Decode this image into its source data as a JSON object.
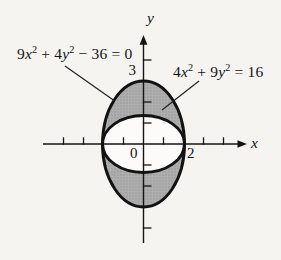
{
  "figure": {
    "type": "math-diagram",
    "colors": {
      "background": "#f5f4f1",
      "shade": "#aeaeae",
      "shade_dots": "#949494",
      "inner_fill": "#fcfbf9",
      "curve": "#121212",
      "axis": "#151515",
      "text": "#141414"
    },
    "equations": {
      "outer": {
        "text": "9x² + 4y² − 36 = 0",
        "segments": [
          {
            "t": "9"
          },
          {
            "t": "x",
            "i": true
          },
          {
            "t": "2",
            "sup": true
          },
          {
            "t": " + 4"
          },
          {
            "t": "y",
            "i": true
          },
          {
            "t": "2",
            "sup": true
          },
          {
            "t": " − 36 = 0"
          }
        ]
      },
      "inner": {
        "text": "4x² + 9y² = 16",
        "segments": [
          {
            "t": "4"
          },
          {
            "t": "x",
            "i": true
          },
          {
            "t": "2",
            "sup": true
          },
          {
            "t": " + 9"
          },
          {
            "t": "y",
            "i": true
          },
          {
            "t": "2",
            "sup": true
          },
          {
            "t": " = 16"
          }
        ]
      }
    },
    "axis_labels": {
      "x": "x",
      "y": "y"
    },
    "tick_labels": {
      "origin": "0",
      "x_2": "2",
      "y_3": "3"
    }
  },
  "chart_data": {
    "type": "line",
    "title": "",
    "xlabel": "x",
    "ylabel": "y",
    "curves": [
      {
        "name": "outer ellipse",
        "equation": "9x^2 + 4y^2 - 36 = 0",
        "x_intercepts": [
          -2,
          2
        ],
        "y_intercepts": [
          -3,
          3
        ]
      },
      {
        "name": "inner ellipse",
        "equation": "4x^2 + 9y^2 = 16",
        "x_intercepts": [
          -2,
          2
        ],
        "y_intercepts": [
          -1.333,
          1.333
        ]
      }
    ],
    "labeled_ticks": {
      "x": [
        0,
        2
      ],
      "y": [
        3
      ]
    },
    "unlabeled_tick_positions": {
      "x": [
        -4,
        -3,
        -1,
        1,
        3,
        4
      ],
      "y": [
        -4,
        -2,
        -1,
        1,
        2,
        4
      ]
    },
    "shaded_region": "inside 9x^2+4y^2=36 and outside 4x^2+9y^2=16 (top and bottom caps)",
    "tangent_points": [
      [
        -2,
        0
      ],
      [
        2,
        0
      ]
    ],
    "grid": false,
    "xlim": [
      -4.9,
      5.1
    ],
    "ylim": [
      -4.8,
      5.1
    ]
  }
}
